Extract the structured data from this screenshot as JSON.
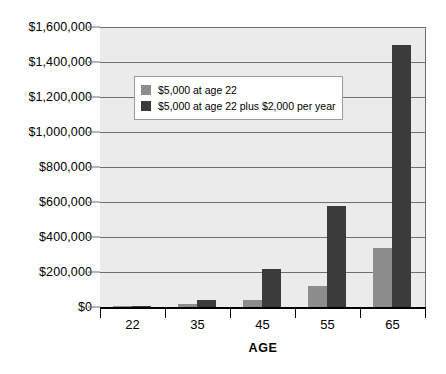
{
  "chart_data": {
    "type": "bar",
    "title": "",
    "subtitle": "",
    "xlabel": "AGE",
    "ylabel": "",
    "categories": [
      "22",
      "35",
      "45",
      "55",
      "65"
    ],
    "series": [
      {
        "name": "$5,000 at age 22",
        "color": "#8d8d8d",
        "values": [
          5000,
          15000,
          40000,
          120000,
          340000
        ]
      },
      {
        "name": "$5,000 at age 22 plus $2,000 per year",
        "color": "#3b3b3b",
        "values": [
          5000,
          40000,
          220000,
          580000,
          1500000
        ]
      }
    ],
    "ylim": [
      0,
      1600000
    ],
    "ytick_values": [
      0,
      200000,
      400000,
      600000,
      800000,
      1000000,
      1200000,
      1400000,
      1600000
    ],
    "ytick_labels": [
      "$0",
      "$200,000",
      "$400,000",
      "$600,000",
      "$800,000",
      "$1,000,000",
      "$1,200,000",
      "$1,400,000",
      "$1,600,000"
    ],
    "grid": true,
    "legend_position": "upper-left-inside",
    "plot_background": "#ebebeb",
    "page_background": "#ffffff",
    "axis_color": "#000000",
    "grid_color": "#6f6f6f"
  }
}
